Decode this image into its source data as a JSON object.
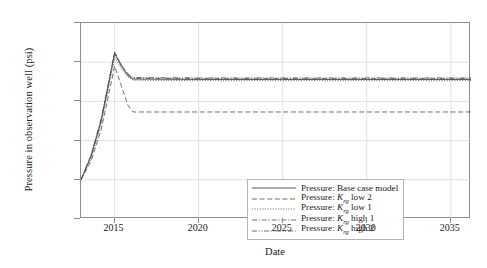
{
  "chart_data": {
    "type": "line",
    "title": "",
    "xlabel": "Date",
    "ylabel": "Pressure in observation well (psi)",
    "xlim": [
      2013.0,
      2036.2
    ],
    "ylim": [
      4300,
      4800
    ],
    "xticks": [
      "2015",
      "2020",
      "2025",
      "2030",
      "2035"
    ],
    "xtick_values": [
      2015,
      2020,
      2025,
      2030,
      2035
    ],
    "yticks": [
      "4,300",
      "4,400",
      "4,500",
      "4,600",
      "4,700",
      "4,800"
    ],
    "ytick_values": [
      4300,
      4400,
      4500,
      4600,
      4700,
      4800
    ],
    "grid": true,
    "legend_position": "lower center (inside axes)",
    "series": [
      {
        "name": "Pressure: Base case model",
        "style": "solid",
        "x": [
          2013.0,
          2013.6,
          2014.2,
          2014.6,
          2015.0,
          2015.4,
          2015.8,
          2016.1,
          2020,
          2025,
          2030,
          2036.2
        ],
        "values": [
          4400,
          4460,
          4550,
          4635,
          4722,
          4690,
          4665,
          4657,
          4656,
          4656,
          4656,
          4656
        ]
      },
      {
        "name": "Pressure: K_rg low 2",
        "style": "dashed",
        "x": [
          2013.0,
          2013.6,
          2014.2,
          2014.6,
          2015.0,
          2015.4,
          2015.8,
          2016.1,
          2020,
          2025,
          2030,
          2036.2
        ],
        "values": [
          4400,
          4448,
          4528,
          4608,
          4690,
          4640,
          4590,
          4573,
          4573,
          4573,
          4573,
          4573
        ]
      },
      {
        "name": "Pressure: K_rg low 1",
        "style": "dash-dot-fine",
        "x": [
          2013.0,
          2013.6,
          2014.2,
          2014.6,
          2015.0,
          2015.4,
          2015.8,
          2016.1,
          2020,
          2025,
          2030,
          2036.2
        ],
        "values": [
          4400,
          4455,
          4542,
          4626,
          4712,
          4684,
          4662,
          4654,
          4653,
          4653,
          4653,
          4653
        ]
      },
      {
        "name": "Pressure: K_rg high 1",
        "style": "dash-dot",
        "x": [
          2013.0,
          2013.6,
          2014.2,
          2014.6,
          2015.0,
          2015.4,
          2015.8,
          2016.1,
          2020,
          2025,
          2030,
          2036.2
        ],
        "values": [
          4400,
          4462,
          4553,
          4638,
          4724,
          4692,
          4668,
          4659,
          4658,
          4658,
          4658,
          4658
        ]
      },
      {
        "name": "Pressure: K_rg high 2",
        "style": "dash-dot-dot",
        "x": [
          2013.0,
          2013.6,
          2014.2,
          2014.6,
          2015.0,
          2015.4,
          2015.8,
          2016.1,
          2020,
          2025,
          2030,
          2036.2
        ],
        "values": [
          4400,
          4464,
          4556,
          4641,
          4726,
          4694,
          4670,
          4661,
          4660,
          4660,
          4660,
          4660
        ]
      }
    ]
  },
  "axes": {
    "ylabel": "Pressure in observation well (psi)",
    "xlabel": "Date",
    "ytick_labels": [
      "4,800",
      "4,700",
      "4,600",
      "4,500",
      "4,400",
      "4,300"
    ],
    "xtick_labels": [
      "2015",
      "2020",
      "2025",
      "2030",
      "2035"
    ]
  },
  "legend": {
    "items": [
      {
        "prefix": "Pressure: ",
        "symbol": "",
        "sub": "",
        "suffix": "Base case model",
        "style": "solid"
      },
      {
        "prefix": "Pressure: ",
        "symbol": "K",
        "sub": "rg",
        "suffix": " low 2",
        "style": "dashed"
      },
      {
        "prefix": "Pressure: ",
        "symbol": "K",
        "sub": "rg",
        "suffix": " low 1",
        "style": "dash-dot-fine"
      },
      {
        "prefix": "Pressure: ",
        "symbol": "K",
        "sub": "rg",
        "suffix": " high 1",
        "style": "dash-dot"
      },
      {
        "prefix": "Pressure: ",
        "symbol": "K",
        "sub": "rg",
        "suffix": " high 2",
        "style": "dash-dot-dot"
      }
    ]
  },
  "colors": {
    "line": "#4d4d4d",
    "grid": "#d9d9d9",
    "frame": "#8d8d8d",
    "text": "#1a1a1a",
    "background": "#ffffff"
  }
}
